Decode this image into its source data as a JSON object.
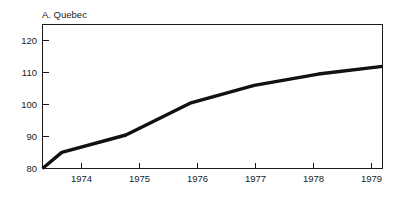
{
  "chart_data": {
    "type": "line",
    "title": "A. Quebec",
    "xlabel": "",
    "ylabel": "",
    "grid": false,
    "legend": null,
    "legend_position": "none",
    "xlim": [
      1973.7,
      1979.0
    ],
    "ylim": [
      80,
      123
    ],
    "xticks": [
      "1974",
      "1975",
      "1976",
      "1977",
      "1978",
      "1979"
    ],
    "yticks": [
      "80",
      "90",
      "100",
      "110",
      "120"
    ],
    "x": [
      1973.7,
      1974,
      1975,
      1976,
      1977,
      1978,
      1979
    ],
    "values": [
      80.0,
      84.8,
      90.0,
      99.5,
      104.8,
      108.2,
      110.5
    ],
    "series": [
      {
        "name": "Quebec",
        "color": "#111111",
        "x": [
          1973.7,
          1974,
          1975,
          1976,
          1977,
          1978,
          1979
        ],
        "values": [
          80.0,
          84.8,
          90.0,
          99.5,
          104.8,
          108.2,
          110.5
        ]
      }
    ]
  },
  "axes": {
    "y_ticks": [
      {
        "label": "120",
        "value": 120
      },
      {
        "label": "110",
        "value": 110
      },
      {
        "label": "100",
        "value": 100
      },
      {
        "label": "90",
        "value": 90
      },
      {
        "label": "80",
        "value": 80
      }
    ],
    "x_ticks": [
      {
        "label": "1974",
        "value": 1974
      },
      {
        "label": "1975",
        "value": 1975
      },
      {
        "label": "1976",
        "value": 1976
      },
      {
        "label": "1977",
        "value": 1977
      },
      {
        "label": "1978",
        "value": 1978
      },
      {
        "label": "1979",
        "value": 1979
      }
    ]
  },
  "colors": {
    "line": "#111111",
    "axis": "#1a1a1a",
    "background": "#ffffff",
    "text": "#1a1a1a"
  }
}
